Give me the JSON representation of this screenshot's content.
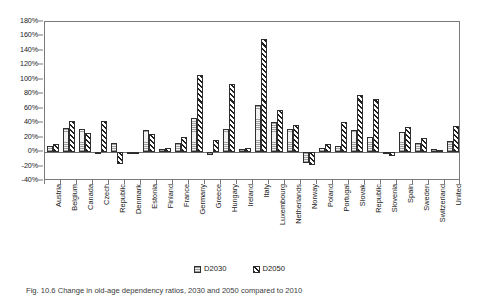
{
  "figure": {
    "caption": "Fig. 10.6 Change in old-age dependency ratios, 2030 and 2050 compared to 2010"
  },
  "legend": {
    "position": "bottom-center",
    "items": [
      {
        "label": "D2030",
        "pattern": "dotted-light"
      },
      {
        "label": "D2050",
        "pattern": "diagonal-hatch"
      }
    ]
  },
  "chart_data": {
    "type": "bar",
    "title": "",
    "xlabel": "",
    "ylabel": "",
    "ylim": [
      -40,
      180
    ],
    "ytick_step": 20,
    "ytick_labels": [
      "180%",
      "160%",
      "140%",
      "120%",
      "100%",
      "80%",
      "60%",
      "40%",
      "20%",
      "0%",
      "-20%",
      "-40%"
    ],
    "ytick_values": [
      180,
      160,
      140,
      120,
      100,
      80,
      60,
      40,
      20,
      0,
      -20,
      -40
    ],
    "grid": false,
    "categories": [
      "Austria",
      "Belgium",
      "Canada",
      "Czech",
      "Republic",
      "Denmark",
      "Estonia",
      "Finland",
      "France",
      "Germany",
      "Greece",
      "Hungary",
      "Ireland",
      "Italy",
      "Luxembourg",
      "Netherlands",
      "Norway",
      "Poland",
      "Portugal",
      "Slovak",
      "Republic",
      "Slovenia",
      "Spain",
      "Sweden",
      "Switzerland",
      "United"
    ],
    "series": [
      {
        "name": "D2030",
        "values": [
          9,
          34,
          32,
          0,
          13,
          -1,
          30,
          4,
          13,
          47,
          -4,
          32,
          4,
          65,
          42,
          32,
          -15,
          5,
          9,
          31,
          21,
          -1,
          28,
          12,
          4,
          15
        ]
      },
      {
        "name": "D2050",
        "values": [
          11,
          43,
          26,
          43,
          -17,
          0,
          25,
          5,
          21,
          106,
          17,
          94,
          5,
          157,
          58,
          38,
          -18,
          11,
          41,
          79,
          73,
          -6,
          35,
          19,
          3,
          36
        ]
      }
    ]
  }
}
